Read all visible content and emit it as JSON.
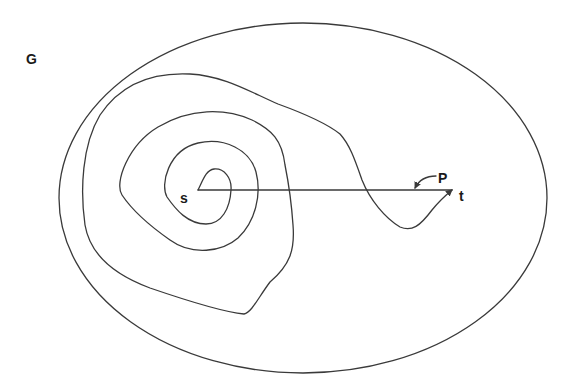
{
  "diagram": {
    "labels": {
      "graph": "G",
      "source": "s",
      "target": "t",
      "path": "P"
    },
    "colors": {
      "stroke": "#3a3a3a",
      "text": "#1a1a1a",
      "background": "#ffffff"
    },
    "elements": [
      {
        "type": "ellipse",
        "name": "region-G"
      },
      {
        "type": "spiral-curve",
        "name": "winding-path",
        "from": "s",
        "to": "t"
      },
      {
        "type": "straight-segment",
        "name": "segment-s-t",
        "from": "s",
        "to": "t"
      },
      {
        "type": "label-pointer",
        "name": "path-P-pointer",
        "target": "segment-s-t"
      }
    ]
  }
}
